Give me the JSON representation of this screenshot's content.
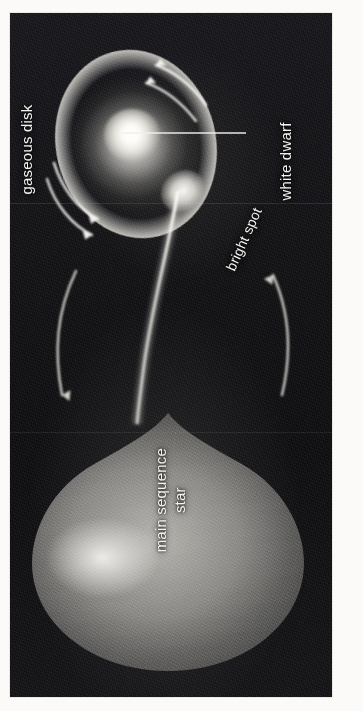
{
  "figure": {
    "type": "astronomy-diagram",
    "orientation": "labels rotated 90 degrees counter-clockwise",
    "background_color": "#ffffff",
    "plate_color": "#101013",
    "ink_color": "#f3f2ee"
  },
  "labels": {
    "gaseous_disk": "gaseous disk",
    "white_dwarf": "white dwarf",
    "bright_spot": "bright spot",
    "main_sequence_line1": "main sequence",
    "main_sequence_line2": "star"
  },
  "components": [
    {
      "name": "gaseous-disk",
      "label": "gaseous disk",
      "description": "elliptical accretion disk with bright limb-brightened rim"
    },
    {
      "name": "white-dwarf",
      "label": "white dwarf",
      "description": "compact brilliant white core at center of disk"
    },
    {
      "name": "bright-spot",
      "label": "bright spot",
      "description": "luminous impact point where accretion stream meets disk rim"
    },
    {
      "name": "main-sequence-star",
      "label": "main sequence star",
      "description": "teardrop shaped Roche-lobe-filling donor star"
    },
    {
      "name": "accretion-stream",
      "label": "",
      "description": "narrow mass-transfer stream from donor star to disk"
    }
  ],
  "arrows": [
    {
      "name": "disk-rotation-arrow-upper-a",
      "meaning": "disk rotation",
      "direction": "counter-clockwise"
    },
    {
      "name": "disk-rotation-arrow-upper-b",
      "meaning": "disk rotation",
      "direction": "counter-clockwise"
    },
    {
      "name": "disk-rotation-arrow-lower-a",
      "meaning": "disk rotation",
      "direction": "counter-clockwise"
    },
    {
      "name": "disk-rotation-arrow-lower-b",
      "meaning": "disk rotation",
      "direction": "counter-clockwise"
    },
    {
      "name": "orbital-arrow-left",
      "meaning": "orbital motion",
      "direction": "downward"
    },
    {
      "name": "orbital-arrow-right",
      "meaning": "orbital motion",
      "direction": "upward"
    }
  ],
  "leader_lines": [
    {
      "name": "white-dwarf-leader",
      "from": "white dwarf core",
      "to": "white dwarf label"
    }
  ]
}
